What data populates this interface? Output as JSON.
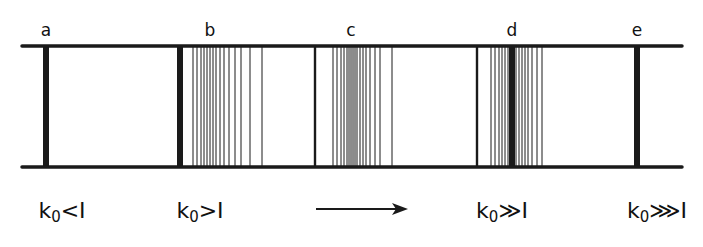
{
  "diagram": {
    "rails": {
      "x1": 22,
      "x2": 682,
      "top_y": 46,
      "bottom_y": 167,
      "color": "#1a1a1a"
    },
    "panels": [
      {
        "label": "a",
        "label_x": 46,
        "condition_base": "k",
        "condition_sub": "0",
        "condition_rel": "<I",
        "condition_x": 62,
        "thick_bars": [
          46
        ],
        "medium_bars": [],
        "thin_lines": []
      },
      {
        "label": "b",
        "label_x": 210,
        "condition_base": "k",
        "condition_sub": "0",
        "condition_rel": ">I",
        "condition_x": 200,
        "thick_bars": [
          180
        ],
        "medium_bars": [],
        "thin_lines": [
          193,
          197,
          201,
          204,
          207,
          210,
          213,
          216,
          220,
          224,
          229,
          235,
          241,
          250,
          262
        ]
      },
      {
        "label": "c",
        "label_x": 351,
        "condition_base": "",
        "condition_sub": "",
        "condition_rel": "",
        "condition_x": 0,
        "thick_bars": [],
        "medium_bars": [
          315
        ],
        "thin_lines": [
          333,
          337,
          341,
          344,
          347,
          349,
          351,
          353,
          355,
          357,
          360,
          363,
          366,
          370,
          375,
          380,
          392
        ]
      },
      {
        "label": "d",
        "label_x": 512,
        "condition_base": "k",
        "condition_sub": "0",
        "condition_rel": "≫I",
        "condition_x": 500,
        "thick_bars": [
          512
        ],
        "medium_bars": [
          477
        ],
        "thin_lines": [
          491,
          495,
          499,
          502,
          505,
          508,
          516,
          519,
          522,
          525,
          528,
          532,
          537,
          542
        ]
      },
      {
        "label": "e",
        "label_x": 637,
        "condition_base": "k",
        "condition_sub": "0",
        "condition_rel": "⋙I",
        "condition_x": 655,
        "thick_bars": [
          637
        ],
        "medium_bars": [],
        "thin_lines": []
      }
    ],
    "arrow": {
      "x1": 316,
      "x2": 408,
      "y": 209,
      "meaning": "increasing k0"
    },
    "labels": {
      "a": "a",
      "b": "b",
      "c": "c",
      "d": "d",
      "e": "e"
    },
    "conditions": {
      "a": "k₀<I",
      "b": "k₀>I",
      "d": "k₀≫I",
      "e": "k₀⋙I"
    }
  }
}
